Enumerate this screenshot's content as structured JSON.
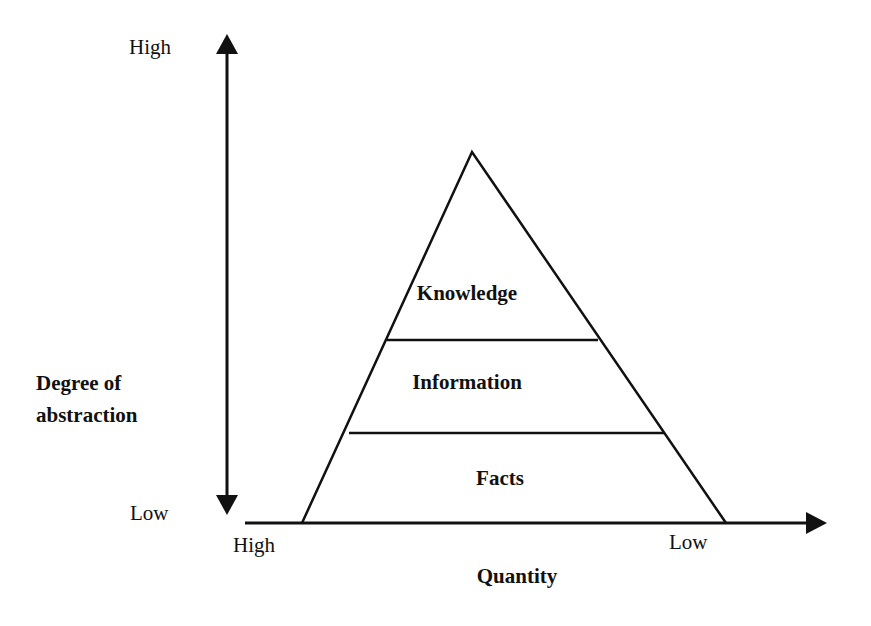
{
  "diagram": {
    "type": "pyramid",
    "levels": [
      {
        "label": "Knowledge",
        "position": "top"
      },
      {
        "label": "Information",
        "position": "middle"
      },
      {
        "label": "Facts",
        "position": "bottom"
      }
    ],
    "y_axis": {
      "title_line1": "Degree of",
      "title_line2": "abstraction",
      "high_label": "High",
      "low_label": "Low"
    },
    "x_axis": {
      "title": "Quantity",
      "left_label": "High",
      "right_label": "Low"
    },
    "colors": {
      "stroke": "#111111",
      "background": "#ffffff"
    }
  }
}
